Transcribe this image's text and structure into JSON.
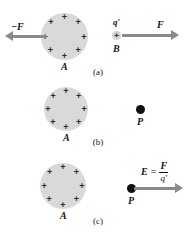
{
  "figure": {
    "type": "physics-diagram",
    "background_color": "#ffffff",
    "sphere_color": "#d9d9d9",
    "arrow_color": "#8a8a8a",
    "point_color": "#111111",
    "text_color": "#141414"
  },
  "panels": [
    {
      "caption": "(a)",
      "sphere": {
        "label": "A",
        "charge_symbol": "+",
        "charge_count": 8
      },
      "force_on_sphere": {
        "label": "−F",
        "direction": "left"
      },
      "test_charge": {
        "symbol": "+",
        "label_above": "q′",
        "label_below": "B"
      },
      "force_on_charge": {
        "label": "F",
        "direction": "right"
      }
    },
    {
      "caption": "(b)",
      "sphere": {
        "label": "A",
        "charge_symbol": "+",
        "charge_count": 8
      },
      "field_point": {
        "label": "P"
      }
    },
    {
      "caption": "(c)",
      "sphere": {
        "label": "A",
        "charge_symbol": "+",
        "charge_count": 8
      },
      "field_point": {
        "label": "P"
      },
      "field_vector": {
        "direction": "right",
        "equation": {
          "lhs": "E",
          "operator": "=",
          "numerator": "F",
          "denominator": "q′"
        }
      }
    }
  ]
}
